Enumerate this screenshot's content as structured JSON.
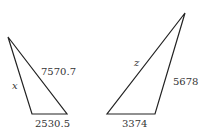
{
  "triangles": [
    {
      "id": "left",
      "vertices": [
        [
          8,
          37
        ],
        [
          32,
          114
        ],
        [
          67,
          114
        ]
      ],
      "labels": {
        "side_hyp": "7570.7",
        "side_left": "x",
        "side_bottom": "2530.5"
      }
    },
    {
      "id": "right",
      "vertices": [
        [
          185,
          13
        ],
        [
          107,
          114
        ],
        [
          155,
          114
        ]
      ],
      "labels": {
        "side_hyp": "z",
        "side_right": "5678",
        "side_bottom": "3374"
      }
    }
  ],
  "colors": {
    "stroke": "#222222",
    "text": "#333333",
    "background": "#ffffff"
  }
}
